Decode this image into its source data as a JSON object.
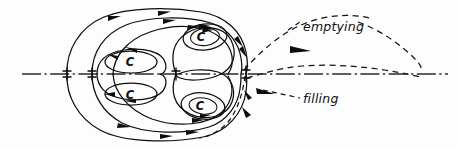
{
  "figure": {
    "background_color": "#fdfdfd",
    "ink_color": "#0d0d0d",
    "width": 458,
    "height": 149
  },
  "annotations": {
    "emptying": {
      "label": "emptying",
      "leader_line": "dashed",
      "arrow_direction": "right"
    },
    "filling": {
      "label": "filling",
      "leader_line": "dashed",
      "arrow_direction": "left"
    }
  },
  "vortex_labels": [
    {
      "id": "upper-outer-vortex",
      "label": "C",
      "x": 205,
      "y": 36
    },
    {
      "id": "upper-inner-vortex",
      "label": "C",
      "x": 130,
      "y": 62
    },
    {
      "id": "lower-inner-vortex",
      "label": "C",
      "x": 130,
      "y": 95
    },
    {
      "id": "lower-outer-vortex",
      "label": "C",
      "x": 203,
      "y": 107
    }
  ],
  "axis": {
    "name": "axis-of-symmetry",
    "style": "dash-dot",
    "y": 74,
    "x_start": 22,
    "x_end": 448
  },
  "stagnation_points": [
    {
      "id": "front-stagnation-point",
      "x": 67,
      "y": 74
    },
    {
      "id": "second-saddle-point",
      "x": 92,
      "y": 74
    },
    {
      "id": "middle-saddle-point",
      "x": 176,
      "y": 74
    },
    {
      "id": "rear-stagnation-point",
      "x": 246,
      "y": 74
    }
  ],
  "flow_features": {
    "outer_boundary": "closed recirculating bubble",
    "nested_cells": 4,
    "dashed_streamlines": 2,
    "solid_streamlines": "multiple nested closed loops with directional arrowheads"
  }
}
